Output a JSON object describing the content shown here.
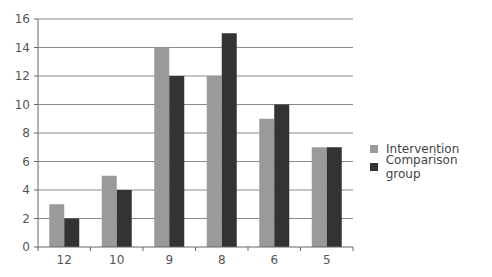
{
  "chart_data": {
    "type": "bar",
    "title": "",
    "xlabel": "",
    "ylabel": "",
    "categories": [
      "12",
      "10",
      "9",
      "8",
      "6",
      "5"
    ],
    "series": [
      {
        "name": "Intervention",
        "color": "#9a9a9a",
        "values": [
          3,
          5,
          14,
          12,
          9,
          7
        ]
      },
      {
        "name": "Comparison group",
        "color": "#333333",
        "values": [
          2,
          4,
          12,
          15,
          10,
          7
        ]
      }
    ],
    "ylim": [
      0,
      16
    ],
    "yticks": [
      0,
      2,
      4,
      6,
      8,
      10,
      12,
      14,
      16
    ],
    "grid": true,
    "legend_position": "right"
  },
  "legend": {
    "items": [
      {
        "label": "Intervention",
        "color": "#9a9a9a"
      },
      {
        "label": "Comparison group",
        "color": "#333333"
      }
    ]
  }
}
